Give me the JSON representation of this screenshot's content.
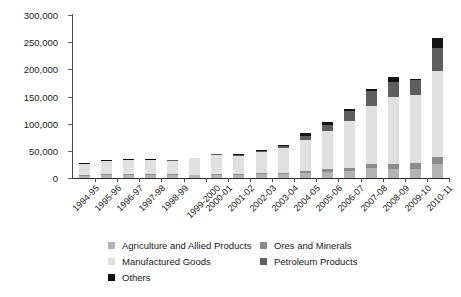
{
  "chart_data": {
    "type": "bar",
    "stacked": true,
    "title": "",
    "subtitle": "",
    "xlabel": "",
    "ylabel": "",
    "ylim": [
      0,
      300000
    ],
    "ytick_step": 50000,
    "ytick_labels": [
      "300,000",
      "250,000",
      "200,000",
      "150,000",
      "100,000",
      "50,000",
      "0"
    ],
    "ytick_values": [
      300000,
      250000,
      200000,
      150000,
      100000,
      50000,
      0
    ],
    "grid": false,
    "legend_position": "bottom",
    "categories": [
      "1994-95",
      "1995-96",
      "1996-97",
      "1997-98",
      "1998-99",
      "1999-2000",
      "2000-01",
      "2001-02",
      "2002-03",
      "2003-04",
      "2004-05",
      "2005-06",
      "2006-07",
      "2007-08",
      "2008-09",
      "2009-10",
      "2010-11"
    ],
    "series": [
      {
        "name": "Agriculture and Allied Products",
        "color": "#b3b3b3",
        "values": [
          4500,
          5200,
          5700,
          5600,
          5400,
          5100,
          6100,
          6000,
          6700,
          7500,
          8400,
          10200,
          12100,
          18100,
          17500,
          17500,
          25000
        ]
      },
      {
        "name": "Ores and Minerals",
        "color": "#8c8c8c",
        "values": [
          1300,
          1400,
          1500,
          1500,
          1400,
          1300,
          1500,
          1500,
          1800,
          2400,
          4200,
          6200,
          7000,
          8600,
          8900,
          9600,
          13500
        ]
      },
      {
        "name": "Manufactured Goods",
        "color": "#e0e0e0",
        "values": [
          20200,
          24800,
          25100,
          26000,
          25400,
          29600,
          34300,
          33400,
          38900,
          45600,
          57100,
          70200,
          85000,
          105000,
          123000,
          125000,
          158000
        ]
      },
      {
        "name": "Petroleum Products",
        "color": "#5e5e5e",
        "values": [
          400,
          450,
          500,
          350,
          90,
          40,
          1900,
          2100,
          2600,
          3600,
          6800,
          11600,
          18600,
          28400,
          27500,
          28200,
          42000
        ]
      },
      {
        "name": "Others",
        "color": "#121212",
        "values": [
          1200,
          1350,
          1400,
          1450,
          1200,
          1100,
          1300,
          900,
          1000,
          1500,
          6700,
          4800,
          4300,
          3000,
          8300,
          2400,
          18500
        ]
      }
    ],
    "totals": [
      27600,
      33200,
      34200,
      34900,
      33490,
      37140,
      45100,
      43900,
      51000,
      60600,
      83200,
      103000,
      127000,
      163100,
      185200,
      182700,
      257000
    ]
  },
  "legend": {
    "items": [
      {
        "label": "Agriculture and Allied Products",
        "color": "#b3b3b3"
      },
      {
        "label": "Ores and Minerals",
        "color": "#8c8c8c"
      },
      {
        "label": "Manufactured Goods",
        "color": "#e0e0e0"
      },
      {
        "label": "Petroleum Products",
        "color": "#5e5e5e"
      },
      {
        "label": "Others",
        "color": "#121212"
      }
    ]
  }
}
